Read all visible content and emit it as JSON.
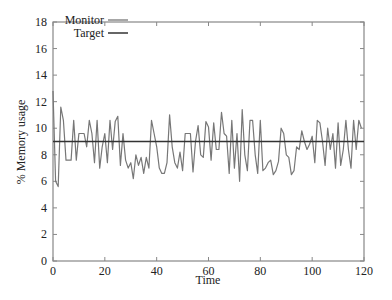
{
  "chart_data": {
    "type": "line",
    "title": "",
    "xlabel": "Time",
    "ylabel": "% Memory usage",
    "xlim": [
      0,
      120
    ],
    "ylim": [
      0,
      18
    ],
    "xticks": [
      0,
      20,
      40,
      60,
      80,
      100,
      120
    ],
    "yticks": [
      0,
      2,
      4,
      6,
      8,
      10,
      12,
      14,
      16,
      18
    ],
    "grid": false,
    "legend_position": "upper-left",
    "series": [
      {
        "name": "Monitor",
        "color": "#777777",
        "x": [
          0,
          1,
          2,
          3,
          4,
          5,
          6,
          7,
          8,
          9,
          10,
          11,
          12,
          13,
          14,
          15,
          16,
          17,
          18,
          19,
          20,
          21,
          22,
          23,
          24,
          25,
          26,
          27,
          28,
          29,
          30,
          31,
          32,
          33,
          34,
          35,
          36,
          37,
          38,
          39,
          40,
          41,
          42,
          43,
          44,
          45,
          46,
          47,
          48,
          49,
          50,
          51,
          52,
          53,
          54,
          55,
          56,
          57,
          58,
          59,
          60,
          61,
          62,
          63,
          64,
          65,
          66,
          67,
          68,
          69,
          70,
          71,
          72,
          73,
          74,
          75,
          76,
          77,
          78,
          79,
          80,
          81,
          82,
          83,
          84,
          85,
          86,
          87,
          88,
          89,
          90,
          91,
          92,
          93,
          94,
          95,
          96,
          97,
          98,
          99,
          100,
          101,
          102,
          103,
          104,
          105,
          106,
          107,
          108,
          109,
          110,
          111,
          112,
          113,
          114,
          115,
          116,
          117,
          118,
          119
        ],
        "values": [
          12.8,
          6.0,
          5.6,
          11.6,
          10.6,
          7.6,
          7.6,
          7.6,
          10.6,
          7.6,
          9.6,
          9.6,
          9.6,
          8.6,
          10.6,
          9.6,
          7.4,
          10.6,
          7.0,
          8.6,
          9.6,
          7.4,
          10.6,
          8.4,
          10.5,
          10.9,
          7.2,
          9.6,
          7.6,
          7.0,
          7.4,
          6.2,
          8.0,
          7.2,
          7.8,
          6.6,
          7.8,
          7.0,
          10.6,
          9.6,
          8.6,
          7.0,
          6.6,
          6.6,
          7.4,
          11.0,
          8.6,
          7.4,
          7.0,
          8.2,
          6.8,
          9.6,
          9.6,
          9.6,
          6.7,
          9.0,
          10.2,
          8.0,
          7.8,
          10.5,
          10.1,
          7.6,
          10.4,
          8.4,
          8.4,
          11.2,
          9.6,
          9.4,
          6.6,
          10.6,
          7.0,
          9.6,
          6.0,
          11.4,
          8.0,
          6.8,
          10.6,
          10.6,
          8.0,
          6.6,
          10.6,
          6.8,
          7.0,
          7.4,
          7.6,
          6.5,
          6.8,
          7.5,
          10.0,
          9.6,
          8.0,
          7.8,
          6.5,
          6.8,
          8.6,
          8.4,
          9.8,
          9.0,
          8.4,
          8.8,
          9.4,
          7.4,
          10.6,
          10.4,
          9.0,
          7.2,
          10.0,
          8.4,
          9.6,
          7.0,
          10.4,
          7.2,
          8.4,
          10.6,
          8.4,
          7.0,
          10.6,
          8.4,
          10.6,
          10.0
        ]
      },
      {
        "name": "Target",
        "color": "#333333",
        "x": [
          0,
          120
        ],
        "values": [
          9.0,
          9.0
        ]
      }
    ]
  },
  "legend": {
    "items": [
      {
        "label": "Monitor"
      },
      {
        "label": "Target"
      }
    ]
  },
  "axes": {
    "xlabel": "Time",
    "ylabel": "% Memory usage",
    "xtick_labels": [
      "0",
      "20",
      "40",
      "60",
      "80",
      "100",
      "120"
    ],
    "ytick_labels": [
      "0",
      "2",
      "4",
      "6",
      "8",
      "10",
      "12",
      "14",
      "16",
      "18"
    ]
  }
}
